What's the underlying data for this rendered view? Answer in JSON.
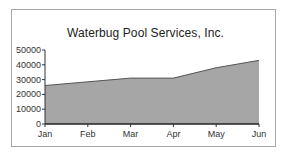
{
  "chart_data": {
    "type": "area",
    "title": "Waterbug Pool Services, Inc.",
    "xlabel": "",
    "ylabel": "",
    "categories": [
      "Jan",
      "Feb",
      "Mar",
      "Apr",
      "May",
      "Jun"
    ],
    "series": [
      {
        "name": "Sales",
        "values": [
          26000,
          28500,
          31000,
          31000,
          38000,
          43000
        ]
      }
    ],
    "ylim": [
      0,
      50000
    ],
    "yticks": [
      0,
      10000,
      20000,
      30000,
      40000,
      50000
    ],
    "ytick_labels": [
      "0",
      "10000",
      "20000",
      "30000",
      "40000",
      "50000"
    ],
    "grid": false,
    "legend": "none",
    "colors": {
      "fill": "#a6a6a6",
      "line": "#555555",
      "axis": "#333333",
      "border": "#a8a8a8"
    }
  }
}
